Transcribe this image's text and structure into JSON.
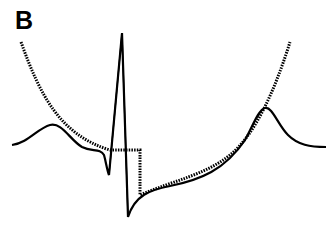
{
  "panel": {
    "label": "B"
  },
  "figure": {
    "traces": [
      {
        "name": "ecg-waveform",
        "style": "solid",
        "color": "#000000",
        "features": [
          "P wave",
          "Q dip",
          "R peak",
          "S dip",
          "ST segment",
          "T wave"
        ]
      },
      {
        "name": "envelope-curve",
        "style": "dotted",
        "color": "#000000",
        "features": [
          "descending left arm",
          "flat segment",
          "vertical step down",
          "ascending right arm"
        ]
      }
    ]
  }
}
